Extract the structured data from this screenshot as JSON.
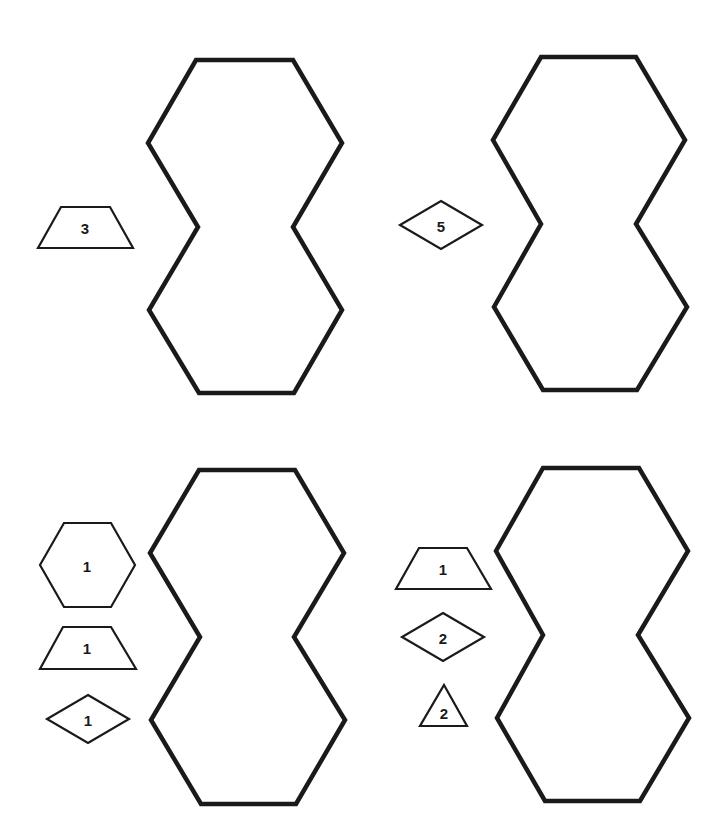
{
  "worksheet": {
    "stroke_color": "#1a1a1a",
    "background_color": "#ffffff",
    "puzzles": [
      {
        "id": "puzzle-top-left",
        "target_shape": "double-hexagon",
        "pieces": [
          {
            "shape": "trapezoid",
            "count": "3"
          }
        ]
      },
      {
        "id": "puzzle-top-right",
        "target_shape": "double-hexagon",
        "pieces": [
          {
            "shape": "rhombus",
            "count": "5"
          }
        ]
      },
      {
        "id": "puzzle-bottom-left",
        "target_shape": "double-hexagon",
        "pieces": [
          {
            "shape": "hexagon",
            "count": "1"
          },
          {
            "shape": "trapezoid",
            "count": "1"
          },
          {
            "shape": "rhombus",
            "count": "1"
          }
        ]
      },
      {
        "id": "puzzle-bottom-right",
        "target_shape": "double-hexagon",
        "pieces": [
          {
            "shape": "trapezoid",
            "count": "1"
          },
          {
            "shape": "rhombus",
            "count": "2"
          },
          {
            "shape": "triangle",
            "count": "2"
          }
        ]
      }
    ]
  }
}
